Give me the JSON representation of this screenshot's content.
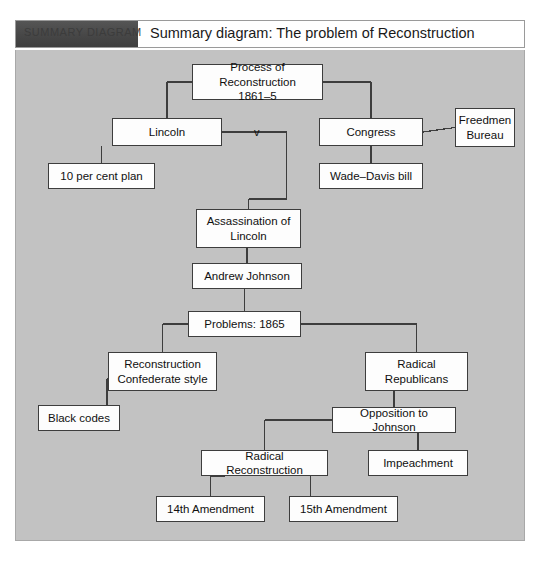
{
  "header": {
    "tab_label": "SUMMARY DIAGRAM",
    "title": "Summary diagram:  The problem of Reconstruction",
    "tab_color": "#4a4a4a",
    "panel_color": "#c2c2c2"
  },
  "diagram": {
    "type": "flowchart",
    "vs_label": "v",
    "nodes": [
      {
        "id": "process",
        "label": "Process of Reconstruction\n1861–5",
        "x": 176,
        "y": 14,
        "w": 131,
        "h": 36
      },
      {
        "id": "lincoln",
        "label": "Lincoln",
        "x": 96,
        "y": 68,
        "w": 110,
        "h": 28
      },
      {
        "id": "congress",
        "label": "Congress",
        "x": 303,
        "y": 68,
        "w": 104,
        "h": 28
      },
      {
        "id": "freedmen",
        "label": "Freedmen\nBureau",
        "x": 439,
        "y": 58,
        "w": 60,
        "h": 39
      },
      {
        "id": "tenpercent",
        "label": "10 per cent plan",
        "x": 32,
        "y": 113,
        "w": 107,
        "h": 26
      },
      {
        "id": "wadedavis",
        "label": "Wade–Davis bill",
        "x": 303,
        "y": 113,
        "w": 104,
        "h": 26
      },
      {
        "id": "assassination",
        "label": "Assassination of\nLincoln",
        "x": 180,
        "y": 159,
        "w": 105,
        "h": 39
      },
      {
        "id": "johnson",
        "label": "Andrew Johnson",
        "x": 176,
        "y": 213,
        "w": 110,
        "h": 26
      },
      {
        "id": "problems",
        "label": "Problems: 1865",
        "x": 172,
        "y": 261,
        "w": 113,
        "h": 26
      },
      {
        "id": "confederate",
        "label": "Reconstruction\nConfederate style",
        "x": 92,
        "y": 302,
        "w": 109,
        "h": 39
      },
      {
        "id": "radicalrep",
        "label": "Radical\nRepublicans",
        "x": 349,
        "y": 302,
        "w": 103,
        "h": 39
      },
      {
        "id": "blackcodes",
        "label": "Black codes",
        "x": 22,
        "y": 355,
        "w": 82,
        "h": 26
      },
      {
        "id": "opposition",
        "label": "Opposition to Johnson",
        "x": 316,
        "y": 357,
        "w": 124,
        "h": 26
      },
      {
        "id": "radicalrecon",
        "label": "Radical Reconstruction",
        "x": 185,
        "y": 400,
        "w": 127,
        "h": 26
      },
      {
        "id": "impeachment",
        "label": "Impeachment",
        "x": 352,
        "y": 400,
        "w": 100,
        "h": 26
      },
      {
        "id": "amend14",
        "label": "14th Amendment",
        "x": 140,
        "y": 446,
        "w": 109,
        "h": 26
      },
      {
        "id": "amend15",
        "label": "15th Amendment",
        "x": 273,
        "y": 446,
        "w": 109,
        "h": 26
      }
    ],
    "edges": [
      {
        "from": "process",
        "to": "lincoln"
      },
      {
        "from": "process",
        "to": "congress"
      },
      {
        "from": "lincoln",
        "to": "tenpercent"
      },
      {
        "from": "lincoln",
        "to": "assassination"
      },
      {
        "from": "congress",
        "to": "freedmen"
      },
      {
        "from": "congress",
        "to": "wadedavis"
      },
      {
        "from": "assassination",
        "to": "johnson"
      },
      {
        "from": "johnson",
        "to": "problems"
      },
      {
        "from": "problems",
        "to": "confederate"
      },
      {
        "from": "problems",
        "to": "radicalrep"
      },
      {
        "from": "confederate",
        "to": "blackcodes"
      },
      {
        "from": "radicalrep",
        "to": "opposition"
      },
      {
        "from": "opposition",
        "to": "radicalrecon"
      },
      {
        "from": "opposition",
        "to": "impeachment"
      },
      {
        "from": "radicalrecon",
        "to": "amend14"
      },
      {
        "from": "radicalrecon",
        "to": "amend15"
      }
    ]
  }
}
